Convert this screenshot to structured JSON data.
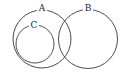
{
  "diagram": {
    "type": "venn",
    "sets": [
      {
        "id": "A",
        "label": "A",
        "cx": 42,
        "cy": 39,
        "r": 29,
        "label_x": 42,
        "label_y": 8
      },
      {
        "id": "B",
        "label": "B",
        "cx": 88,
        "cy": 39,
        "r": 29.5,
        "label_x": 88,
        "label_y": 8
      },
      {
        "id": "C",
        "label": "C",
        "cx": 35,
        "cy": 44,
        "r": 19,
        "label_x": 34,
        "label_y": 25
      }
    ],
    "relations": [
      "C is a subset of A",
      "A and B overlap"
    ],
    "stroke_color": "#3a3a3a"
  }
}
